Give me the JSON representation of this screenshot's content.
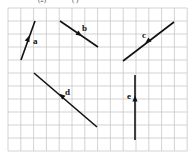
{
  "header": {
    "fragment_left": "(2)",
    "fragment_right": "( )"
  },
  "grid": {
    "x0": 8,
    "y0": 8,
    "cols": 14,
    "rows": 11,
    "cell_w": 12.8,
    "cell_h": 13,
    "line_color": "#c8c8c8"
  },
  "vectors": [
    {
      "name": "a",
      "x1": 21,
      "y1": 60,
      "x2": 35,
      "y2": 21,
      "arrow": [
        28,
        39
      ],
      "arrow_dir": "toward-end",
      "label_pos": [
        33,
        44
      ]
    },
    {
      "name": "b",
      "x1": 60,
      "y1": 21,
      "x2": 98,
      "y2": 47,
      "arrow": [
        79,
        34
      ],
      "arrow_dir": "toward-end",
      "label_pos": [
        82,
        31
      ]
    },
    {
      "name": "c",
      "x1": 174,
      "y1": 22,
      "x2": 123,
      "y2": 61,
      "arrow": [
        148,
        41
      ],
      "arrow_dir": "toward-end",
      "label_pos": [
        142,
        38
      ]
    },
    {
      "name": "d",
      "x1": 97,
      "y1": 127,
      "x2": 34,
      "y2": 73,
      "arrow": [
        62,
        96
      ],
      "arrow_dir": "toward-end",
      "label_pos": [
        65,
        95
      ]
    },
    {
      "name": "e",
      "x1": 135,
      "y1": 140,
      "x2": 135,
      "y2": 75,
      "arrow": [
        135,
        99
      ],
      "arrow_dir": "toward-end",
      "label_pos": [
        127,
        99
      ]
    }
  ],
  "stroke_color": "#111111"
}
